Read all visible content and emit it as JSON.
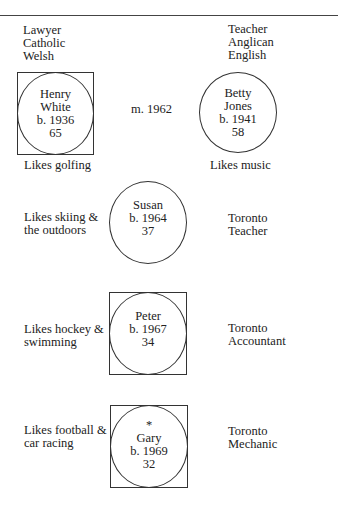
{
  "parents": {
    "father": {
      "attributes": [
        "Lawyer",
        "Catholic",
        "Welsh"
      ],
      "name_line1": "Henry",
      "name_line2": "White",
      "birth": "b. 1936",
      "age": "65",
      "note": "Likes golfing",
      "shape": "male"
    },
    "mother": {
      "attributes": [
        "Teacher",
        "Anglican",
        "English"
      ],
      "name_line1": "Betty",
      "name_line2": "Jones",
      "birth": "b. 1941",
      "age": "58",
      "note": "Likes music",
      "shape": "female"
    },
    "marriage": "m. 1962"
  },
  "children": [
    {
      "name": "Susan",
      "birth": "b. 1964",
      "age": "37",
      "hobby_line1": "Likes skiing &",
      "hobby_line2": "the outdoors",
      "location": "Toronto",
      "occupation": "Teacher",
      "shape": "female"
    },
    {
      "name": "Peter",
      "birth": "b. 1967",
      "age": "34",
      "hobby_line1": "Likes hockey &",
      "hobby_line2": "swimming",
      "location": "Toronto",
      "occupation": "Accountant",
      "shape": "male"
    },
    {
      "marker": "*",
      "name": "Gary",
      "birth": "b. 1969",
      "age": "32",
      "hobby_line1": "Likes football &",
      "hobby_line2": "car racing",
      "location": "Toronto",
      "occupation": "Mechanic",
      "shape": "male"
    }
  ]
}
